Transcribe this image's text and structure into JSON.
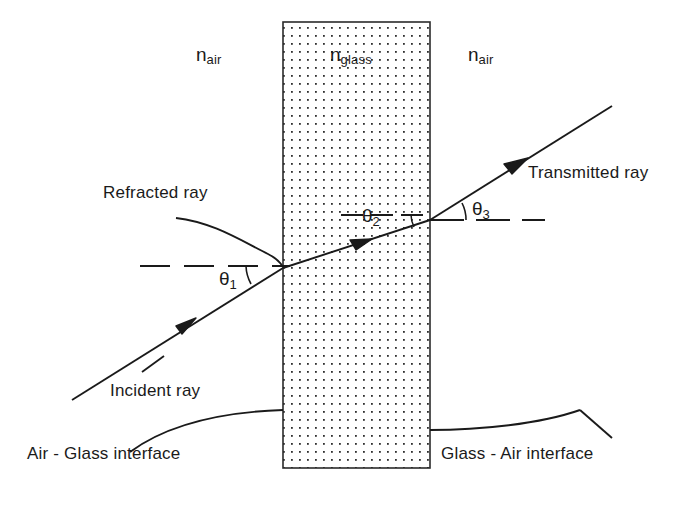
{
  "figure": {
    "type": "optics-ray-diagram",
    "background_color": "#ffffff",
    "line_color": "#1a1a1a"
  },
  "media": {
    "left_label": "n",
    "left_sub": "air",
    "middle_label": "n",
    "middle_sub": "glass",
    "right_label": "n",
    "right_sub": "air"
  },
  "angles": {
    "theta1": "θ",
    "theta1_sub": "1",
    "theta2": "θ",
    "theta2_sub": "2",
    "theta3": "θ",
    "theta3_sub": "3"
  },
  "rays": {
    "incident": "Incident ray",
    "refracted": "Refracted ray",
    "transmitted": "Transmitted ray"
  },
  "interfaces": {
    "left": "Air - Glass interface",
    "right": "Glass - Air interface"
  },
  "slab": {
    "left_x": 283,
    "right_x": 430,
    "top_y": 22,
    "bottom_y": 468,
    "fill_pattern": "dot-grid",
    "dot_spacing_px": 8,
    "border_color": "#2b2b2b"
  },
  "geometry": {
    "entry_point": [
      283,
      268
    ],
    "exit_point": [
      430,
      220
    ],
    "incident_start": [
      72,
      400
    ],
    "transmitted_end": [
      612,
      106
    ],
    "normal_reference_left_y": 266,
    "normal_reference_mid_y": 215,
    "normal_reference_right_y": 220
  }
}
